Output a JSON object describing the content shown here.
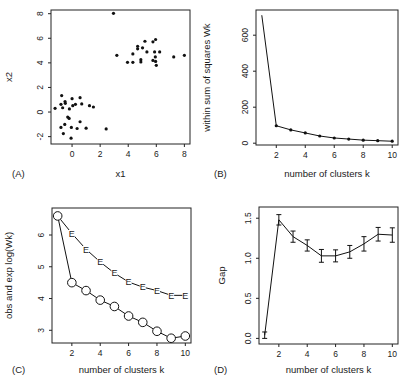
{
  "figure": {
    "panels": [
      "(A)",
      "(B)",
      "(C)",
      "(D)"
    ]
  },
  "chart_data": [
    {
      "panel": "(A)",
      "type": "scatter",
      "title": "",
      "xlabel": "x1",
      "ylabel": "x2",
      "xlim": [
        -1.5,
        8.4
      ],
      "ylim": [
        -2.6,
        8.3
      ],
      "xticks": [
        0,
        2,
        4,
        6,
        8
      ],
      "yticks": [
        -2,
        0,
        2,
        4,
        6,
        8
      ],
      "grid": false,
      "points": [
        [
          -0.74,
          1.34
        ],
        [
          -1.21,
          0.3
        ],
        [
          -0.79,
          0.63
        ],
        [
          -0.67,
          0.35
        ],
        [
          -0.5,
          0.85
        ],
        [
          -0.48,
          0.71
        ],
        [
          -0.19,
          0.25
        ],
        [
          0.0,
          1.09
        ],
        [
          0.05,
          0.52
        ],
        [
          0.24,
          0.63
        ],
        [
          0.57,
          1.17
        ],
        [
          0.69,
          0.66
        ],
        [
          1.24,
          0.52
        ],
        [
          1.52,
          0.41
        ],
        [
          -0.31,
          -0.41
        ],
        [
          -0.21,
          -0.52
        ],
        [
          0.57,
          -0.79
        ],
        [
          -0.52,
          -1.01
        ],
        [
          -0.79,
          -1.25
        ],
        [
          -0.05,
          -1.25
        ],
        [
          0.36,
          -1.34
        ],
        [
          1.0,
          -1.31
        ],
        [
          2.43,
          -1.37
        ],
        [
          -0.62,
          -1.75
        ],
        [
          -0.07,
          -2.13
        ],
        [
          2.95,
          8.03
        ],
        [
          3.19,
          4.61
        ],
        [
          3.95,
          4.04
        ],
        [
          4.33,
          4.04
        ],
        [
          4.33,
          4.73
        ],
        [
          4.67,
          5.35
        ],
        [
          4.67,
          5.14
        ],
        [
          5.02,
          5.22
        ],
        [
          5.19,
          5.76
        ],
        [
          5.33,
          4.89
        ],
        [
          4.9,
          4.26
        ],
        [
          4.9,
          4.07
        ],
        [
          5.76,
          5.71
        ],
        [
          5.95,
          5.9
        ],
        [
          5.88,
          4.89
        ],
        [
          6.24,
          4.89
        ],
        [
          5.93,
          4.48
        ],
        [
          5.76,
          4.2
        ],
        [
          5.95,
          4.12
        ],
        [
          6.0,
          3.8
        ],
        [
          7.24,
          4.48
        ],
        [
          8.0,
          4.61
        ]
      ]
    },
    {
      "panel": "(B)",
      "type": "line",
      "title": "",
      "xlabel": "number of clusters k",
      "ylabel": "within sum of squares Wk",
      "xlim": [
        0.6,
        10.4
      ],
      "ylim": [
        -10,
        740
      ],
      "xticks": [
        2,
        4,
        6,
        8,
        10
      ],
      "yticks": [
        0,
        200,
        400,
        600
      ],
      "grid": false,
      "x": [
        1,
        2,
        3,
        4,
        5,
        6,
        7,
        8,
        9,
        10
      ],
      "values": [
        711,
        97,
        74,
        57,
        40,
        29,
        23,
        17,
        14,
        11
      ],
      "markers": "dot (k>=2)"
    },
    {
      "panel": "(C)",
      "type": "line",
      "title": "",
      "xlabel": "number of clusters k",
      "ylabel": "obs and exp log(Wk)",
      "xlim": [
        0.6,
        10.4
      ],
      "ylim": [
        2.6,
        6.85
      ],
      "xticks": [
        2,
        4,
        6,
        8,
        10
      ],
      "yticks": [
        3,
        4,
        5,
        6
      ],
      "grid": false,
      "x": [
        1,
        2,
        3,
        4,
        5,
        6,
        7,
        8,
        9,
        10
      ],
      "series": [
        {
          "name": "E (expected)",
          "marker": "E",
          "values": [
            6.6,
            6.05,
            5.55,
            5.15,
            4.8,
            4.52,
            4.36,
            4.25,
            4.1,
            4.1
          ]
        },
        {
          "name": "O (observed)",
          "marker": "O",
          "values": [
            6.6,
            4.5,
            4.25,
            3.95,
            3.75,
            3.45,
            3.25,
            2.97,
            2.75,
            2.82
          ]
        }
      ]
    },
    {
      "panel": "(D)",
      "type": "line",
      "title": "",
      "xlabel": "number of clusters k",
      "ylabel": "Gap",
      "xlim": [
        0.6,
        10.4
      ],
      "ylim": [
        -0.07,
        1.64
      ],
      "xticks": [
        2,
        4,
        6,
        8,
        10
      ],
      "yticks": [
        0.0,
        0.5,
        1.0,
        1.5
      ],
      "ytick_labels": [
        "0.0",
        "0.5",
        "1.0",
        "1.5"
      ],
      "grid": false,
      "x": [
        1,
        2,
        3,
        4,
        5,
        6,
        7,
        8,
        9,
        10
      ],
      "values": [
        0.04,
        1.48,
        1.27,
        1.16,
        1.03,
        1.03,
        1.08,
        1.18,
        1.3,
        1.29
      ],
      "error": [
        0.04,
        0.065,
        0.07,
        0.07,
        0.08,
        0.075,
        0.08,
        0.09,
        0.085,
        0.09
      ]
    }
  ]
}
